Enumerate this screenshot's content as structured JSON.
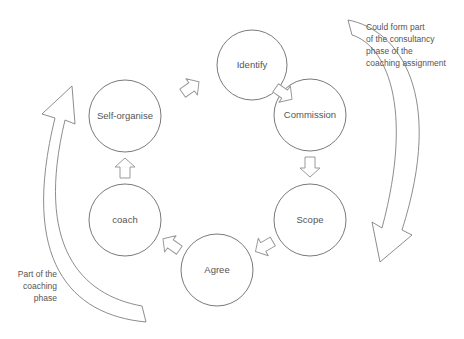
{
  "diagram": {
    "nodes": [
      {
        "id": "identify",
        "label": "Identify"
      },
      {
        "id": "commission",
        "label": "Commission"
      },
      {
        "id": "scope",
        "label": "Scope"
      },
      {
        "id": "agree",
        "label": "Agree"
      },
      {
        "id": "coach",
        "label": "coach"
      },
      {
        "id": "self-organise",
        "label": "Self-organise"
      }
    ],
    "annotations": {
      "consultancy": [
        "Could form part",
        "of the consultancy",
        "phase of the",
        "coaching assignment"
      ],
      "coaching": [
        "Part of the",
        "coaching",
        "phase"
      ]
    },
    "colors": {
      "stroke": "#7a7a7a",
      "text": "#555555",
      "background": "#ffffff"
    }
  }
}
